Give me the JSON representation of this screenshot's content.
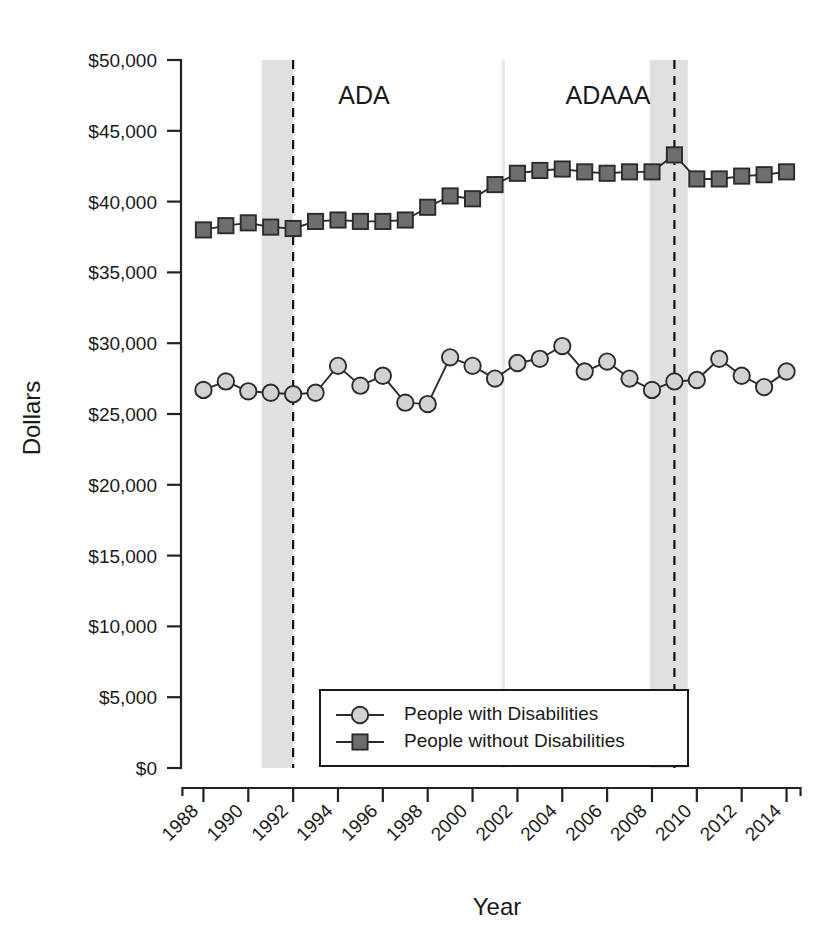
{
  "figure": {
    "title_clipped": "",
    "background": "#ffffff"
  },
  "axes": {
    "ylabel": "Dollars",
    "xlabel": "Year"
  },
  "legend": {
    "entries": [
      {
        "label": "People with Disabilities",
        "marker": "circle",
        "color": "#d2d2d2"
      },
      {
        "label": "People without Disabilities",
        "marker": "square",
        "color": "#6e6e6e"
      }
    ]
  },
  "annotations": [
    {
      "name": "ada",
      "label": "ADA",
      "year": 1992
    },
    {
      "name": "adaaa",
      "label": "ADAAA",
      "year": 2009
    }
  ],
  "chart_data": {
    "type": "line",
    "title": "",
    "xlabel": "Year",
    "ylabel": "Dollars",
    "xlim": [
      1987,
      2014.6
    ],
    "ylim": [
      0,
      50000
    ],
    "yticks": [
      0,
      5000,
      10000,
      15000,
      20000,
      25000,
      30000,
      35000,
      40000,
      45000,
      50000
    ],
    "ytick_labels": [
      "$0",
      "$5,000",
      "$10,000",
      "$15,000",
      "$20,000",
      "$25,000",
      "$30,000",
      "$35,000",
      "$40,000",
      "$45,000",
      "$50,000"
    ],
    "xticks": [
      1988,
      1990,
      1992,
      1994,
      1996,
      1998,
      2000,
      2002,
      2004,
      2006,
      2008,
      2010,
      2012,
      2014
    ],
    "xtick_labels": [
      "1988",
      "1990",
      "1992",
      "1994",
      "1996",
      "1998",
      "2000",
      "2002",
      "2004",
      "2006",
      "2008",
      "2010",
      "2012",
      "2014"
    ],
    "grid": false,
    "legend_position": "bottom-center",
    "x": [
      1988,
      1989,
      1990,
      1991,
      1992,
      1993,
      1994,
      1995,
      1996,
      1997,
      1998,
      1999,
      2000,
      2001,
      2002,
      2003,
      2004,
      2005,
      2006,
      2007,
      2008,
      2009,
      2010,
      2011,
      2012,
      2013,
      2014
    ],
    "series": [
      {
        "name": "People with Disabilities",
        "marker": "circle",
        "color": "#d2d2d2",
        "values": [
          26700,
          27300,
          26600,
          26500,
          26400,
          26500,
          28400,
          27000,
          27700,
          25800,
          25700,
          29000,
          28400,
          27500,
          28600,
          28900,
          29800,
          28000,
          28700,
          27500,
          26700,
          27300,
          27400,
          28900,
          27700,
          26900,
          28000
        ]
      },
      {
        "name": "People without Disabilities",
        "marker": "square",
        "color": "#6e6e6e",
        "values": [
          38000,
          38300,
          38500,
          38200,
          38100,
          38600,
          38700,
          38600,
          38600,
          38700,
          39600,
          40400,
          40200,
          41200,
          42000,
          42200,
          42300,
          42100,
          42000,
          42100,
          42100,
          43300,
          41600,
          41600,
          41800,
          41900,
          42100
        ]
      }
    ],
    "recession_bands": [
      {
        "start": 1990.6,
        "end": 1992.0
      },
      {
        "start": 2001.3,
        "end": 2001.45
      },
      {
        "start": 2007.9,
        "end": 2009.6
      }
    ]
  }
}
